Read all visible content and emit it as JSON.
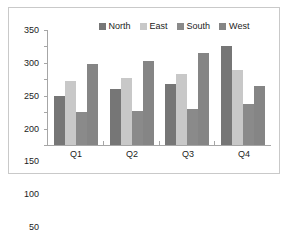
{
  "chart_data": {
    "type": "bar",
    "title": "",
    "subtitle": "",
    "xlabel": "",
    "ylabel": "",
    "categories": [
      "Q1",
      "Q2",
      "Q3",
      "Q4"
    ],
    "series": [
      {
        "name": "North",
        "color": "#767676",
        "values": [
          150,
          170,
          185,
          302
        ]
      },
      {
        "name": "East",
        "color": "#c8c8c8",
        "values": [
          195,
          203,
          216,
          228
        ]
      },
      {
        "name": "South",
        "color": "#8a8a8a",
        "values": [
          102,
          104,
          111,
          126
        ]
      },
      {
        "name": "West",
        "color": "#858585",
        "values": [
          247,
          255,
          279,
          180
        ]
      }
    ],
    "ylim": [
      0,
      350
    ],
    "y_ticks": [
      0,
      50,
      100,
      150,
      200,
      250,
      300,
      350
    ],
    "y_tick_labels": [
      "0",
      "50",
      "100",
      "150",
      "200",
      "250",
      "300",
      "350"
    ],
    "grid": false,
    "legend_position": "top-center",
    "annotations": []
  },
  "frame": {
    "border_color": "#c9c9c9",
    "background": "#ffffff",
    "axis_color": "#a6a6a6"
  }
}
